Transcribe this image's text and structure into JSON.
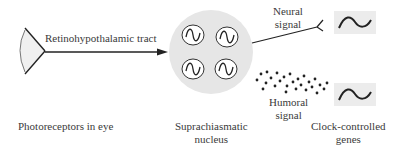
{
  "diagram": {
    "pathway_label": "Retinohypothalamic tract",
    "neural_signal": [
      "Neural",
      "signal"
    ],
    "humoral_signal": [
      "Humoral",
      "signal"
    ],
    "captions": {
      "eye": "Photoreceptors in eye",
      "scn": [
        "Suprachiasmatic",
        "nucleus"
      ],
      "genes": [
        "Clock-controlled",
        "genes"
      ]
    },
    "colors": {
      "line": "#222222",
      "scn_fill": "#e6e6e6",
      "gene_box_fill": "#ececec",
      "eye_fill": "#f0f0f0"
    }
  }
}
